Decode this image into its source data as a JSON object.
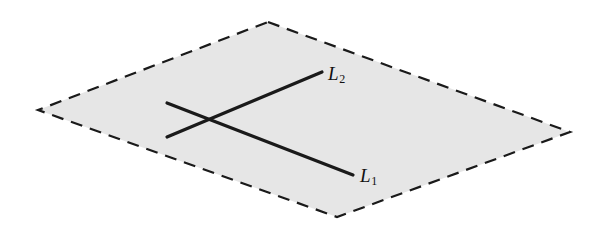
{
  "figure": {
    "canvas": {
      "width": 594,
      "height": 228,
      "background": "#ffffff"
    },
    "plane": {
      "name": "plane",
      "fill": "#e6e6e6",
      "stroke": "#1a1a1a",
      "stroke_width": 2.2,
      "dash_pattern": "12 8",
      "vertices": [
        {
          "x": 268,
          "y": 22
        },
        {
          "x": 570,
          "y": 132
        },
        {
          "x": 337,
          "y": 217
        },
        {
          "x": 38,
          "y": 110
        }
      ],
      "points_attr": "268,22 570,132 337,217 38,110"
    },
    "lines": [
      {
        "id": "L1",
        "label_text": "L",
        "label_subscript": "1",
        "stroke": "#1a1a1a",
        "stroke_width": 3.2,
        "x1": 167,
        "y1": 103,
        "x2": 353,
        "y2": 175,
        "label_left": 360,
        "label_top": 166
      },
      {
        "id": "L2",
        "label_text": "L",
        "label_subscript": "2",
        "stroke": "#1a1a1a",
        "stroke_width": 3.2,
        "x1": 167,
        "y1": 137,
        "x2": 322,
        "y2": 72,
        "label_left": 328,
        "label_top": 64
      }
    ],
    "intersection": {
      "x": 208,
      "y": 120
    }
  }
}
